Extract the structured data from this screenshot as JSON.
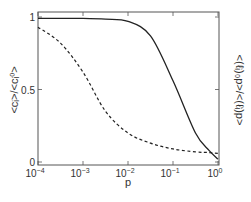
{
  "chart_data": {
    "type": "line",
    "title": "",
    "xlabel": "p",
    "ylabel": "<c_i>/<c_i^0>",
    "ylabel_right": "<(l_i)_0 p>/<(l_i) p>",
    "xscale": "log",
    "xlim": [
      0.0001,
      1
    ],
    "ylim": [
      0,
      1
    ],
    "x_ticks": [
      "10^-4",
      "10^-3",
      "10^-2",
      "10^-1",
      "10^0"
    ],
    "y_ticks": [
      "0",
      "0.5",
      "1"
    ],
    "grid": false,
    "legend": null,
    "x": [
      0.0001,
      0.000316,
      0.001,
      0.00316,
      0.01,
      0.0316,
      0.1,
      0.316,
      0.631,
      1
    ],
    "series": [
      {
        "name": "<c_i>/<c_i^0>",
        "style": "solid",
        "axis": "left",
        "values": [
          0.99,
          0.99,
          0.99,
          0.985,
          0.97,
          0.87,
          0.56,
          0.2,
          0.08,
          0.02
        ]
      },
      {
        "name": "<(l_i)_0 p>/<(l_i) p>",
        "style": "dashed",
        "axis": "right",
        "values": [
          0.93,
          0.82,
          0.62,
          0.35,
          0.2,
          0.13,
          0.09,
          0.07,
          0.065,
          0.06
        ]
      }
    ]
  },
  "labels": {
    "xlabel": "p",
    "ylabel_left": "<c",
    "ylabel_left_full": "<cᵢ>/<cᵢ⁰>",
    "ylabel_right_full": "<(ℓᵢ)₀p>/<(ℓᵢ)p>",
    "xticks": [
      {
        "base": "10",
        "exp": "−4"
      },
      {
        "base": "10",
        "exp": "−3"
      },
      {
        "base": "10",
        "exp": "−2"
      },
      {
        "base": "10",
        "exp": "−1"
      },
      {
        "base": "10",
        "exp": "0"
      }
    ],
    "yticks": [
      "0",
      "0.5",
      "1"
    ]
  }
}
